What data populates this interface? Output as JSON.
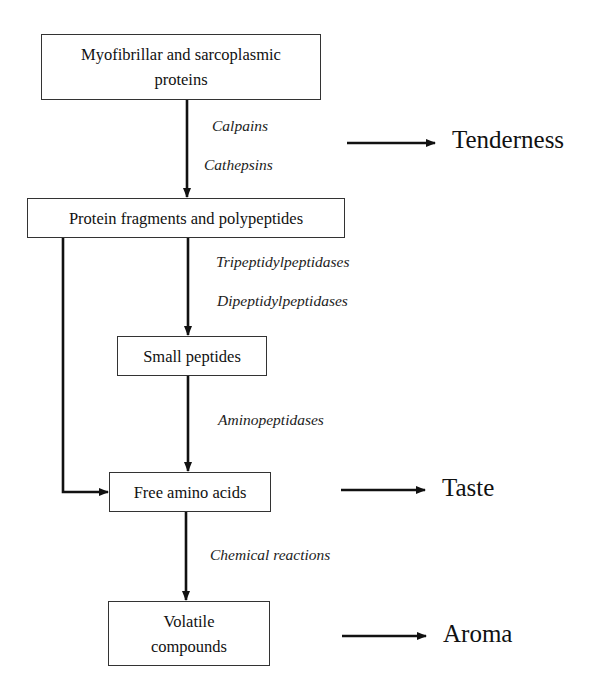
{
  "diagram": {
    "nodes": [
      {
        "id": "proteins",
        "label_line1": "Myofibrillar and sarcoplasmic",
        "label_line2": "proteins"
      },
      {
        "id": "fragments",
        "label": "Protein fragments and polypeptides"
      },
      {
        "id": "small_peptides",
        "label": "Small peptides"
      },
      {
        "id": "free_amino_acids",
        "label": "Free amino acids"
      },
      {
        "id": "volatile",
        "label_line1": "Volatile",
        "label_line2": "compounds"
      }
    ],
    "enzymes": {
      "step1": [
        "Calpains",
        "Cathepsins"
      ],
      "step2": [
        "Tripeptidylpeptidases",
        "Dipeptidylpeptidases"
      ],
      "step3": [
        "Aminopeptidases"
      ],
      "step4": [
        "Chemical reactions"
      ]
    },
    "outcomes": {
      "tenderness": "Tenderness",
      "taste": "Taste",
      "aroma": "Aroma"
    },
    "edges": [
      {
        "from": "proteins",
        "to": "fragments",
        "via": "step1"
      },
      {
        "from": "fragments",
        "to": "small_peptides",
        "via": "step2"
      },
      {
        "from": "small_peptides",
        "to": "free_amino_acids",
        "via": "step3"
      },
      {
        "from": "fragments",
        "to": "free_amino_acids",
        "via": "direct"
      },
      {
        "from": "free_amino_acids",
        "to": "volatile",
        "via": "step4"
      },
      {
        "from": "step1",
        "to": "tenderness"
      },
      {
        "from": "free_amino_acids",
        "to": "taste"
      },
      {
        "from": "volatile",
        "to": "aroma"
      }
    ]
  }
}
